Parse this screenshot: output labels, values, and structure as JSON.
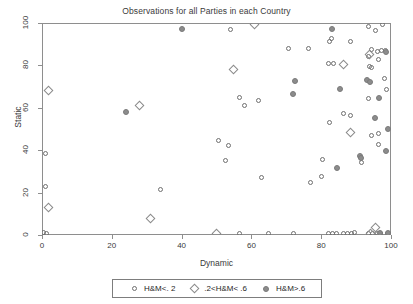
{
  "chart_data": {
    "type": "scatter",
    "title": "Observations for all Parties in each Country",
    "xlabel": "Dynamic",
    "ylabel": "Static",
    "xlim": [
      0,
      100
    ],
    "ylim": [
      0,
      100
    ],
    "xticks": [
      "0",
      "20",
      "40",
      "60",
      "80",
      "100"
    ],
    "yticks": [
      "0",
      "20",
      "40",
      "60",
      "80",
      "100"
    ],
    "xtick_values": [
      0,
      20,
      40,
      60,
      80,
      100
    ],
    "ytick_values": [
      0,
      20,
      40,
      60,
      80,
      100
    ],
    "grid": false,
    "legend_position": "bottom",
    "series": [
      {
        "name": "H&M<. 2",
        "marker": "circle-open",
        "color": "#6f6f6f",
        "points": [
          [
            1.0,
            23.0
          ],
          [
            0.4,
            1.0
          ],
          [
            1.2,
            0.6
          ],
          [
            54.0,
            97.0
          ],
          [
            70.5,
            88.0
          ],
          [
            76.5,
            88.0
          ],
          [
            83.0,
            92.5
          ],
          [
            93.5,
            98.5
          ],
          [
            95.5,
            96.5
          ],
          [
            97.5,
            99.5
          ],
          [
            82.5,
            91.5
          ],
          [
            88.5,
            91.5
          ],
          [
            94.5,
            87.5
          ],
          [
            96.0,
            86.5
          ],
          [
            97.2,
            86.8
          ],
          [
            98.3,
            87.2
          ],
          [
            93.6,
            84.0
          ],
          [
            96.3,
            83.0
          ],
          [
            82.0,
            81.0
          ],
          [
            83.6,
            81.0
          ],
          [
            93.8,
            79.5
          ],
          [
            94.5,
            78.8
          ],
          [
            98.0,
            74.0
          ],
          [
            98.6,
            68.5
          ],
          [
            93.5,
            64.5
          ],
          [
            56.5,
            65.0
          ],
          [
            58.0,
            61.0
          ],
          [
            62.0,
            63.5
          ],
          [
            86.5,
            57.5
          ],
          [
            88.5,
            56.5
          ],
          [
            82.5,
            53.0
          ],
          [
            94.5,
            47.0
          ],
          [
            96.5,
            48.0
          ],
          [
            96.3,
            42.5
          ],
          [
            50.5,
            44.5
          ],
          [
            53.5,
            42.0
          ],
          [
            52.5,
            35.0
          ],
          [
            80.5,
            35.5
          ],
          [
            80.0,
            27.5
          ],
          [
            91.5,
            34.0
          ],
          [
            63.0,
            27.0
          ],
          [
            77.0,
            25.0
          ],
          [
            1.0,
            38.5
          ],
          [
            34.0,
            21.5
          ],
          [
            89.5,
            1.0
          ],
          [
            56.5,
            0.8
          ],
          [
            65.0,
            0.8
          ],
          [
            72.0,
            0.8
          ],
          [
            82.0,
            0.7
          ],
          [
            83.2,
            0.7
          ],
          [
            84.4,
            0.7
          ],
          [
            86.5,
            0.7
          ],
          [
            87.6,
            0.7
          ],
          [
            88.8,
            0.7
          ],
          [
            93.5,
            0.7
          ],
          [
            94.7,
            0.7
          ],
          [
            96.0,
            0.7
          ],
          [
            97.0,
            0.7
          ],
          [
            99.0,
            0.7
          ]
        ]
      },
      {
        "name": ".2<H&M< .6",
        "marker": "diamond-open",
        "color": "#8a8a8a",
        "points": [
          [
            2.0,
            68.0
          ],
          [
            28.0,
            61.0
          ],
          [
            61.0,
            99.5
          ],
          [
            55.0,
            78.0
          ],
          [
            86.5,
            80.5
          ],
          [
            93.8,
            85.0
          ],
          [
            88.5,
            48.5
          ],
          [
            2.0,
            13.0
          ],
          [
            31.0,
            8.0
          ],
          [
            50.0,
            0.8
          ],
          [
            95.5,
            3.5
          ],
          [
            94.0,
            0.8
          ]
        ]
      },
      {
        "name": "H&M>.6",
        "marker": "circle-filled",
        "color": "#8c8c8c",
        "points": [
          [
            40.0,
            97.0
          ],
          [
            83.0,
            97.0
          ],
          [
            98.5,
            86.5
          ],
          [
            72.5,
            72.5
          ],
          [
            72.0,
            66.5
          ],
          [
            85.5,
            69.0
          ],
          [
            93.0,
            73.0
          ],
          [
            94.0,
            72.2
          ],
          [
            96.5,
            64.5
          ],
          [
            95.5,
            55.0
          ],
          [
            99.0,
            50.0
          ],
          [
            98.5,
            39.5
          ],
          [
            91.0,
            37.5
          ],
          [
            91.5,
            36.5
          ],
          [
            84.5,
            31.5
          ],
          [
            24.0,
            58.0
          ],
          [
            99.0,
            0.8
          ],
          [
            96.8,
            0.8
          ]
        ]
      }
    ]
  },
  "legend": {
    "entries": [
      {
        "label": "H&M<. 2",
        "marker": "circle-open"
      },
      {
        "label": ".2<H&M< .6",
        "marker": "diamond-open"
      },
      {
        "label": "H&M>.6",
        "marker": "circle-filled"
      }
    ]
  }
}
